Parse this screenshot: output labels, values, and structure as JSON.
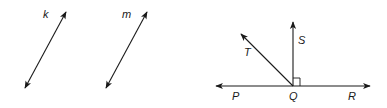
{
  "figure_left": {
    "lines": [
      {
        "label": "k",
        "x1": 25,
        "y1": 88,
        "x2": 66,
        "y2": 12,
        "label_x": 44,
        "label_y": 18
      },
      {
        "label": "m",
        "x1": 106,
        "y1": 88,
        "x2": 147,
        "y2": 12,
        "label_x": 122,
        "label_y": 18
      }
    ]
  },
  "figure_right": {
    "vertex": {
      "label": "Q",
      "x": 293,
      "y": 86
    },
    "rays": [
      {
        "label": "P",
        "to_x": 216,
        "to_y": 86
      },
      {
        "label": "R",
        "to_x": 370,
        "to_y": 86
      },
      {
        "label": "S",
        "to_x": 293,
        "to_y": 22
      },
      {
        "label": "T",
        "to_x": 240,
        "to_y": 33
      }
    ],
    "labels": {
      "P": "P",
      "Q": "Q",
      "R": "R",
      "S": "S",
      "T": "T"
    },
    "right_angle_marker": "SQR"
  },
  "colors": {
    "stroke": "#1a1a1a",
    "background": "#ffffff"
  }
}
